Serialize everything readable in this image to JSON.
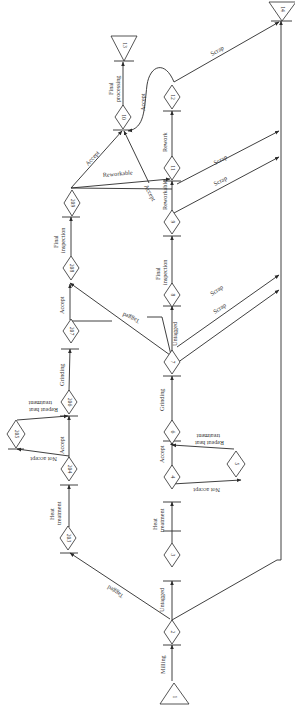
{
  "nodes": {
    "n1": "1",
    "n2": "2",
    "n3": "3",
    "n4": "4",
    "n5": "5",
    "n6": "6",
    "n7": "7",
    "n8": "8",
    "n9": "9",
    "n10": "10",
    "n11": "11",
    "n12": "12",
    "n13": "13",
    "n14": "14",
    "n203": "203",
    "n204": "204",
    "n205": "205",
    "n206": "206",
    "n207": "207",
    "n208": "208",
    "n209": "209"
  },
  "edges": {
    "milling": "Milling",
    "untagged_2_3": "Untagged",
    "tagged_2_203": "Tagged",
    "scrap_2_14": "Scrap",
    "heat_treatment_a": "Heat",
    "heat_treatment_b": "treatment",
    "accept_4": "Accept",
    "not_accept_4": "Not accept",
    "repeat_5_a": "Repeat heat",
    "repeat_5_b": "treatment",
    "grinding_6": "Grinding",
    "untagged_7": "Untagged",
    "tagged_7": "Tagged",
    "scrap_7_a": "Scrap",
    "scrap_7_b": "Scrap",
    "final_insp_8_a": "Final",
    "final_insp_8_b": "inspection",
    "reworkable_9": "Reworkable",
    "scrap_9_a": "Scrap",
    "scrap_9_b": "Scrap",
    "accept_9": "Accept",
    "rework_11": "Rework",
    "accept_12": "Accept",
    "scrap_12": "Scrap",
    "final_proc_a": "Final",
    "final_proc_b": "processing",
    "heat_treatment_203_a": "Heat",
    "heat_treatment_203_b": "treatment",
    "accept_204": "Accept",
    "not_accept_204": "Not accept",
    "repeat_205_a": "Repeat heat",
    "repeat_205_b": "treatment",
    "grinding_206": "Grinding",
    "accept_207": "Accept",
    "final_insp_208_a": "Final",
    "final_insp_208_b": "inspection",
    "accept_209": "Accept",
    "reworkable_209": "Reworkable"
  }
}
